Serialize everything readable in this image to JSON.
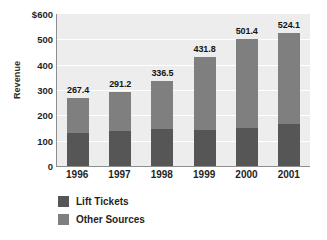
{
  "chart_data": {
    "type": "bar",
    "subtype": "stacked-vertical-bar",
    "title": "",
    "xlabel": "",
    "ylabel": "Revenue",
    "categories": [
      "1996",
      "1997",
      "1998",
      "1999",
      "2000",
      "2001"
    ],
    "series": [
      {
        "name": "Lift Tickets",
        "color": "#565656",
        "values": [
          130,
          137,
          147,
          144,
          149,
          165
        ]
      },
      {
        "name": "Other Sources",
        "color": "#7f7f7f",
        "values": [
          137.4,
          154.2,
          189.5,
          287.8,
          352.4,
          359.1
        ]
      }
    ],
    "totals": [
      267.4,
      291.2,
      336.5,
      431.8,
      501.4,
      524.1
    ],
    "total_labels": [
      "267.4",
      "291.2",
      "336.5",
      "431.8",
      "501.4",
      "524.1"
    ],
    "ylim": [
      0,
      600
    ],
    "ytick_values": [
      0,
      100,
      200,
      300,
      400,
      500,
      600
    ],
    "ytick_labels": [
      "0",
      "100",
      "200",
      "300",
      "400",
      "500",
      "$600"
    ],
    "grid": true,
    "grid_axis": "y",
    "legend_position": "bottom-left",
    "plot_background": "#ededed",
    "gridline_color": "#ffffff",
    "axis_color": "#8e8e8e"
  },
  "legend": {
    "items": [
      {
        "label": "Lift Tickets",
        "color": "#565656"
      },
      {
        "label": "Other Sources",
        "color": "#7f7f7f"
      }
    ]
  }
}
